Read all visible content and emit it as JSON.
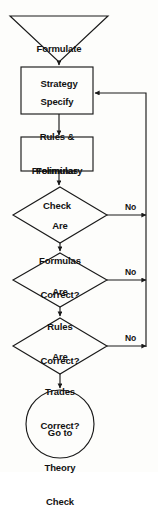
{
  "diagram": {
    "stroke_color": "#1a1a1a",
    "text_color": "#121212",
    "background_color": "#fdfdfb",
    "nodes": [
      {
        "id": "formulate-strategy",
        "shape": "inverted-triangle",
        "lines": [
          "Formulate",
          "Strategy"
        ]
      },
      {
        "id": "specify-rules",
        "shape": "rectangle",
        "lines": [
          "Specify",
          "Rules &",
          "Formulas"
        ]
      },
      {
        "id": "preliminary-check",
        "shape": "rectangle",
        "lines": [
          "Preliminary",
          "Check"
        ]
      },
      {
        "id": "formulas-correct",
        "shape": "diamond",
        "lines": [
          "Are",
          "Formulas",
          "Correct?"
        ]
      },
      {
        "id": "rules-correct",
        "shape": "diamond",
        "lines": [
          "Are",
          "Rules",
          "Correct?"
        ]
      },
      {
        "id": "trades-correct",
        "shape": "diamond",
        "lines": [
          "Are",
          "Trades",
          "Correct?"
        ]
      },
      {
        "id": "go-to-theory-check",
        "shape": "circle",
        "lines": [
          "Go to",
          "Theory",
          "Check"
        ]
      }
    ],
    "edge_labels": {
      "no_formulas": "No",
      "no_rules": "No",
      "no_trades": "No"
    }
  }
}
